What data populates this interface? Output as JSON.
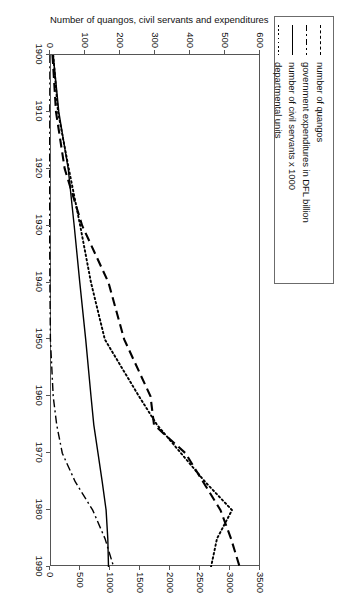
{
  "figure": {
    "legend": {
      "entries": [
        {
          "label": "number of quangos",
          "style": "dashed"
        },
        {
          "label": "government expenditures in DFL billion",
          "style": "dashdot"
        },
        {
          "label": "number of civil servants x 1000",
          "style": "solid"
        },
        {
          "label": "departmental units",
          "style": "dotted"
        }
      ]
    }
  },
  "chart_data": {
    "type": "line",
    "title": "",
    "xlabel": "",
    "ylabel": "Number of quangos, civil servants and expenditures",
    "y2label": "Number of departmental units",
    "xlim": [
      1900,
      1990
    ],
    "ylim": [
      0,
      600
    ],
    "y2lim": [
      0,
      3500
    ],
    "grid": false,
    "legend_position": "top-left-outside",
    "xticks": [
      1900,
      1910,
      1920,
      1930,
      1940,
      1950,
      1960,
      1970,
      1980,
      1990
    ],
    "yticks": [
      0,
      100,
      200,
      300,
      400,
      500,
      600
    ],
    "y2ticks": [
      0,
      500,
      1000,
      1500,
      2000,
      2500,
      3000,
      3500
    ],
    "x": [
      1900,
      1910,
      1920,
      1930,
      1940,
      1950,
      1960,
      1965,
      1970,
      1975,
      1980,
      1985,
      1990
    ],
    "series": [
      {
        "name": "number of quangos",
        "style": "dashed",
        "axis": "left",
        "values": [
          10,
          20,
          45,
          95,
          170,
          215,
          290,
          300,
          390,
          440,
          490,
          520,
          545
        ]
      },
      {
        "name": "government expenditures in DFL billion",
        "style": "dashdot",
        "axis": "left",
        "values": [
          0.3,
          0.6,
          1.2,
          1.8,
          2.5,
          4,
          12,
          22,
          38,
          75,
          125,
          160,
          185
        ]
      },
      {
        "name": "number of civil servants x 1000",
        "style": "solid",
        "axis": "left",
        "values": [
          12,
          28,
          55,
          72,
          88,
          105,
          120,
          128,
          140,
          152,
          163,
          168,
          170
        ]
      },
      {
        "name": "departmental units",
        "style": "dotted",
        "axis": "right",
        "values": [
          70,
          150,
          330,
          520,
          700,
          930,
          1500,
          1800,
          2200,
          2600,
          3050,
          2800,
          2700
        ]
      }
    ]
  }
}
